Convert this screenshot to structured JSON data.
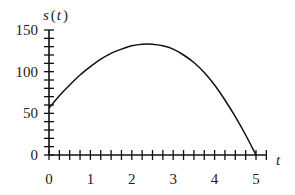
{
  "chart_data": {
    "type": "line",
    "title": "",
    "xlabel": "t",
    "ylabel": "s(t)",
    "xlim": [
      0,
      5
    ],
    "ylim": [
      0,
      150
    ],
    "x_ticks": [
      0,
      1,
      2,
      3,
      4,
      5
    ],
    "x_tick_labels": [
      "0",
      "1",
      "2",
      "3",
      "4",
      "5"
    ],
    "x_minor_step": 0.25,
    "y_ticks": [
      0,
      50,
      100,
      150
    ],
    "y_tick_labels": [
      "0",
      "50",
      "100",
      "150"
    ],
    "y_minor_step": 10,
    "grid": false,
    "legend": "none",
    "series": [
      {
        "name": "s(t)",
        "x": [
          0,
          0.25,
          0.5,
          0.75,
          1,
          1.25,
          1.5,
          1.75,
          2,
          2.25,
          2.5,
          2.75,
          3,
          3.25,
          3.5,
          3.75,
          4,
          4.25,
          4.5,
          4.75,
          5
        ],
        "y": [
          56,
          71,
          84,
          96,
          106,
          115,
          122,
          127,
          131,
          133,
          133,
          131,
          127,
          120,
          111,
          99,
          84,
          66,
          46,
          24,
          0
        ]
      }
    ]
  }
}
